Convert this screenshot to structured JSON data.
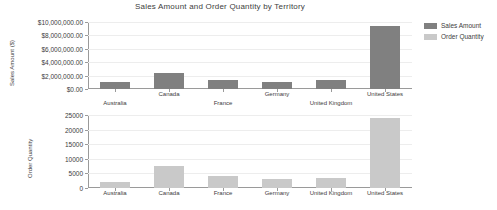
{
  "chart_data": [
    {
      "type": "bar",
      "title": "Sales Amount and Order Quantity by Territory",
      "xlabel": "",
      "ylabel": "Sales Amount ($)",
      "categories": [
        "Australia",
        "Canada",
        "France",
        "Germany",
        "United Kingdom",
        "United States"
      ],
      "series": [
        {
          "name": "Sales Amount",
          "color": "#808080",
          "values": [
            1100000,
            2400000,
            1400000,
            1000000,
            1300000,
            9400000
          ]
        }
      ],
      "ylim": [
        0,
        10000000
      ],
      "yticks": [
        0,
        2000000,
        4000000,
        6000000,
        8000000,
        10000000
      ],
      "ytick_labels": [
        "$0.00",
        "$2,000,000.00",
        "$4,000,000.00",
        "$6,000,000.00",
        "$8,000,000.00",
        "$10,000,000.00"
      ],
      "grid": true,
      "legend_position": "right"
    },
    {
      "type": "bar",
      "title": "",
      "xlabel": "",
      "ylabel": "Order Quantity",
      "categories": [
        "Australia",
        "Canada",
        "France",
        "Germany",
        "United Kingdom",
        "United States"
      ],
      "series": [
        {
          "name": "Order Quantity",
          "color": "#c9c9c9",
          "values": [
            2000,
            7600,
            4000,
            3000,
            3400,
            24000
          ]
        }
      ],
      "ylim": [
        0,
        25000
      ],
      "yticks": [
        0,
        5000,
        10000,
        15000,
        20000,
        25000
      ],
      "ytick_labels": [
        "0",
        "5000",
        "10000",
        "15000",
        "20000",
        "25000"
      ],
      "grid": true,
      "legend_position": "right"
    }
  ],
  "legend": {
    "items": [
      {
        "label": "Sales Amount",
        "color": "#808080"
      },
      {
        "label": "Order Quantity",
        "color": "#c9c9c9"
      }
    ]
  }
}
